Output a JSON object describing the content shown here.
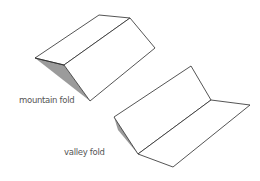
{
  "diagram": {
    "labels": {
      "mountain": "mountain fold",
      "valley": "valley fold"
    },
    "colors": {
      "line": "#2a2a2a",
      "shade": "#8a8a8a",
      "label": "#555555"
    }
  }
}
